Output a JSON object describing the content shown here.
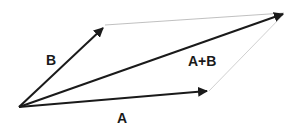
{
  "diagram": {
    "labels": {
      "a": "A",
      "b": "B",
      "sum": "A+B"
    },
    "colors": {
      "vector": "#1a1a1a",
      "guide": "#b0b0b0",
      "background": "#ffffff"
    },
    "points": {
      "origin": [
        19,
        107
      ],
      "a_tip": [
        209,
        91
      ],
      "b_tip": [
        105,
        26
      ],
      "sum_tip": [
        286,
        13
      ]
    }
  }
}
